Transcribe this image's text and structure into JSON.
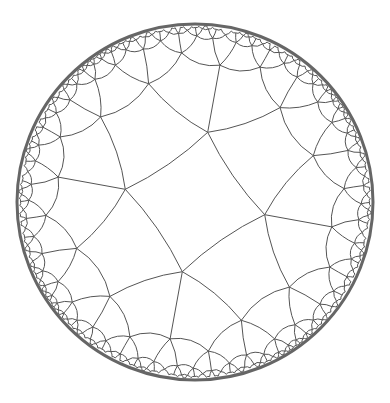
{
  "figure": {
    "background": "#ffffff",
    "stroke_color": "#555555",
    "boundary_color": "#666666",
    "disk": {
      "cx": 195,
      "cy": 202,
      "r": 178
    },
    "tiling": {
      "p": 4,
      "q": 5,
      "levels": 5
    }
  }
}
